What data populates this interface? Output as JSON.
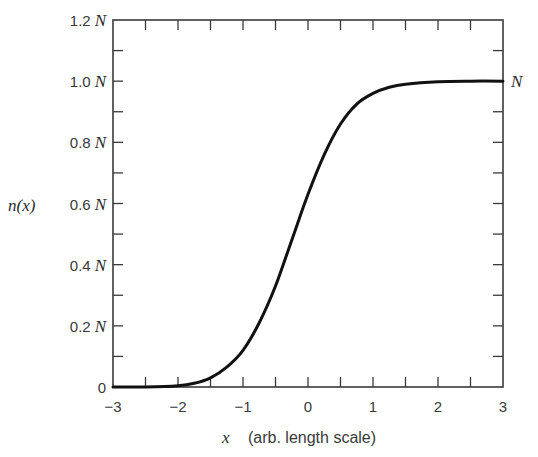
{
  "chart_data": {
    "type": "line",
    "title": "",
    "xlabel_var": "x",
    "xlabel_text": "(arb. length scale)",
    "ylabel": "n(x)",
    "right_label": "N",
    "xlim": [
      -3,
      3
    ],
    "ylim": [
      0,
      1.2
    ],
    "grid": false,
    "legend": null,
    "x_ticks": [
      -3,
      -2,
      -1,
      0,
      1,
      2,
      3
    ],
    "x_tick_labels": [
      "−3",
      "−2",
      "−1",
      "0",
      "1",
      "2",
      "3"
    ],
    "x_minor_step": 0.5,
    "y_ticks": [
      0,
      0.2,
      0.4,
      0.6,
      0.8,
      1.0,
      1.2
    ],
    "y_tick_labels": [
      {
        "num": "0",
        "unit": ""
      },
      {
        "num": "0.2",
        "unit": "N"
      },
      {
        "num": "0.4",
        "unit": "N"
      },
      {
        "num": "0.6",
        "unit": "N"
      },
      {
        "num": "0.8",
        "unit": "N"
      },
      {
        "num": "1.0",
        "unit": "N"
      },
      {
        "num": "1.2",
        "unit": "N"
      }
    ],
    "y_minor_step": 0.1,
    "series": [
      {
        "name": "n(x)",
        "color": "#111111",
        "x": [
          -3.0,
          -2.5,
          -2.0,
          -1.75,
          -1.5,
          -1.25,
          -1.0,
          -0.75,
          -0.5,
          -0.25,
          0.0,
          0.25,
          0.5,
          0.75,
          1.0,
          1.25,
          1.5,
          2.0,
          2.5,
          3.0
        ],
        "values": [
          0.0,
          0.0,
          0.004,
          0.012,
          0.03,
          0.065,
          0.12,
          0.21,
          0.33,
          0.48,
          0.63,
          0.76,
          0.86,
          0.925,
          0.96,
          0.98,
          0.99,
          0.998,
          1.0,
          1.0
        ]
      }
    ]
  }
}
